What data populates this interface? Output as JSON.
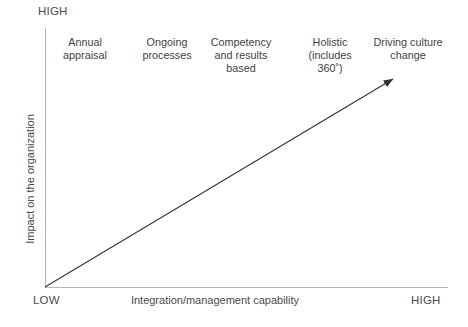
{
  "diagram": {
    "axes": {
      "y_title": "Impact on the organization",
      "y_high_label": "HIGH",
      "x_title": "Integration/management capability",
      "x_low_label": "LOW",
      "x_high_label": "HIGH"
    },
    "arrow": {
      "name": "maturity-trend-arrow",
      "color": "#333333",
      "from_x": 45,
      "from_y": 287,
      "to_x": 393,
      "to_y": 79
    },
    "stages": [
      {
        "lines": [
          "Annual",
          "appraisal"
        ]
      },
      {
        "lines": [
          "Ongoing",
          "processes"
        ]
      },
      {
        "lines": [
          "Competency",
          "and results",
          "based"
        ]
      },
      {
        "lines": [
          "Holistic",
          "(includes",
          "360˚)"
        ]
      },
      {
        "lines": [
          "Driving culture",
          "change"
        ]
      }
    ]
  },
  "chart_data": {
    "type": "scatter",
    "title": "",
    "xlabel": "Integration/management capability",
    "ylabel": "Impact on the organization",
    "xlim": [
      "LOW",
      "HIGH"
    ],
    "ylim": [
      "LOW",
      "HIGH"
    ],
    "grid": false,
    "legend": null,
    "annotations": [
      "Annual appraisal",
      "Ongoing processes",
      "Competency and results based",
      "Holistic (includes 360˚)",
      "Driving culture change"
    ],
    "series": [
      {
        "name": "Performance management maturity",
        "points": [
          {
            "label": "Annual appraisal",
            "x": 1,
            "y": 1
          },
          {
            "label": "Ongoing processes",
            "x": 2,
            "y": 2
          },
          {
            "label": "Competency and results based",
            "x": 3,
            "y": 3
          },
          {
            "label": "Holistic (includes 360˚)",
            "x": 4,
            "y": 4
          },
          {
            "label": "Driving culture change",
            "x": 5,
            "y": 5
          }
        ]
      }
    ]
  }
}
